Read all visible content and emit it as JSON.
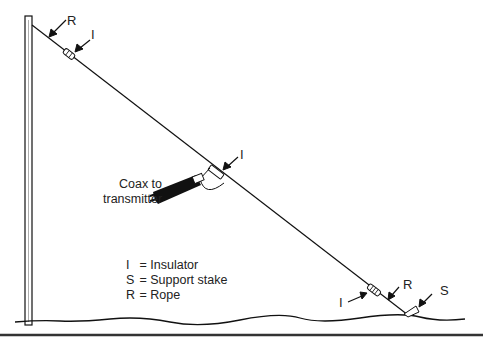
{
  "diagram": {
    "labels": {
      "rope_top": "R",
      "insulator_top": "I",
      "insulator_middle": "I",
      "insulator_bottom": "I",
      "rope_bottom": "R",
      "stake": "S"
    },
    "coax_label": {
      "line1": "Coax to",
      "line2": "transmitter"
    },
    "legend": [
      {
        "key": "I",
        "sep": "=",
        "value": "Insulator"
      },
      {
        "key": "S",
        "sep": "=",
        "value": "Support stake"
      },
      {
        "key": "R",
        "sep": "=",
        "value": "Rope"
      }
    ]
  }
}
